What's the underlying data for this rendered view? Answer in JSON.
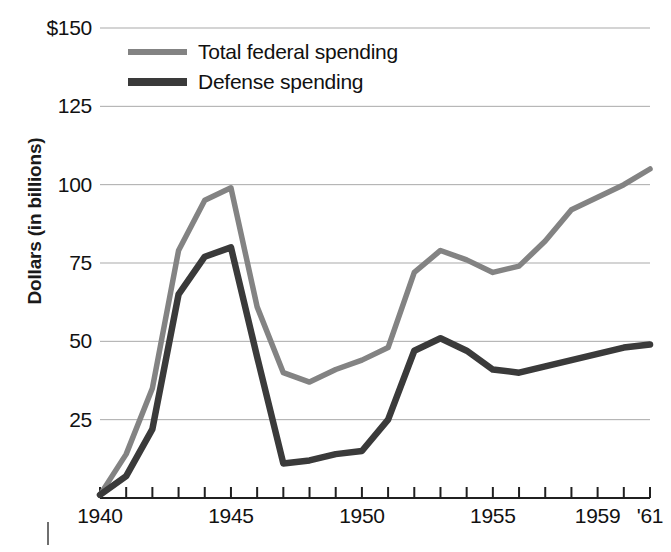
{
  "chart_data": {
    "type": "line",
    "title": "",
    "xlabel": "",
    "ylabel": "Dollars (in billions)",
    "ylim": [
      0,
      150
    ],
    "xlim": [
      1940,
      1961
    ],
    "grid": true,
    "legend_position": "top-left-inside",
    "y_ticks": [
      {
        "value": 150,
        "label": "$150"
      },
      {
        "value": 125,
        "label": "125"
      },
      {
        "value": 100,
        "label": "100"
      },
      {
        "value": 75,
        "label": "75"
      },
      {
        "value": 50,
        "label": "50"
      },
      {
        "value": 25,
        "label": "25"
      }
    ],
    "x_ticks": [
      {
        "value": 1940,
        "label": "1940"
      },
      {
        "value": 1941,
        "label": ""
      },
      {
        "value": 1942,
        "label": ""
      },
      {
        "value": 1943,
        "label": ""
      },
      {
        "value": 1944,
        "label": ""
      },
      {
        "value": 1945,
        "label": "1945"
      },
      {
        "value": 1946,
        "label": ""
      },
      {
        "value": 1947,
        "label": ""
      },
      {
        "value": 1948,
        "label": ""
      },
      {
        "value": 1949,
        "label": ""
      },
      {
        "value": 1950,
        "label": "1950"
      },
      {
        "value": 1951,
        "label": ""
      },
      {
        "value": 1952,
        "label": ""
      },
      {
        "value": 1953,
        "label": ""
      },
      {
        "value": 1954,
        "label": ""
      },
      {
        "value": 1955,
        "label": "1955"
      },
      {
        "value": 1956,
        "label": ""
      },
      {
        "value": 1957,
        "label": ""
      },
      {
        "value": 1958,
        "label": ""
      },
      {
        "value": 1959,
        "label": "1959"
      },
      {
        "value": 1960,
        "label": ""
      },
      {
        "value": 1961,
        "label": "'61"
      }
    ],
    "x": [
      1940,
      1941,
      1942,
      1943,
      1944,
      1945,
      1946,
      1947,
      1948,
      1949,
      1950,
      1951,
      1952,
      1953,
      1954,
      1955,
      1956,
      1957,
      1958,
      1959,
      1960,
      1961
    ],
    "series": [
      {
        "name": "Total federal spending",
        "color": "#838383",
        "values": [
          1,
          14,
          35,
          79,
          95,
          99,
          61,
          40,
          37,
          41,
          44,
          48,
          72,
          79,
          76,
          72,
          74,
          82,
          92,
          96,
          100,
          105
        ]
      },
      {
        "name": "Defense spending",
        "color": "#3a3a3a",
        "values": [
          1,
          7,
          22,
          65,
          77,
          80,
          45,
          11,
          12,
          14,
          15,
          25,
          47,
          51,
          47,
          41,
          40,
          42,
          44,
          46,
          48,
          49
        ]
      }
    ]
  },
  "legend": {
    "items": [
      {
        "label": "Total federal spending",
        "key": "total"
      },
      {
        "label": "Defense spending",
        "key": "defense"
      }
    ]
  },
  "axis": {
    "y_title": "Dollars (in billions)"
  }
}
